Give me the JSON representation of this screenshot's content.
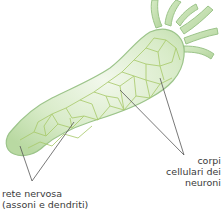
{
  "figure": {
    "colors": {
      "body_fill": "#cfe6bf",
      "body_light": "#eef6e6",
      "body_stroke": "#9cc48a",
      "nerve": "#a8c96a",
      "leader_line": "#555555",
      "text": "#3a3a3a"
    }
  },
  "labels": {
    "left": {
      "line1": "rete nervosa",
      "line2": "(assoni e dendriti)"
    },
    "right": {
      "line1": "corpi",
      "line2": "cellulari dei",
      "line3": "neuroni"
    }
  }
}
